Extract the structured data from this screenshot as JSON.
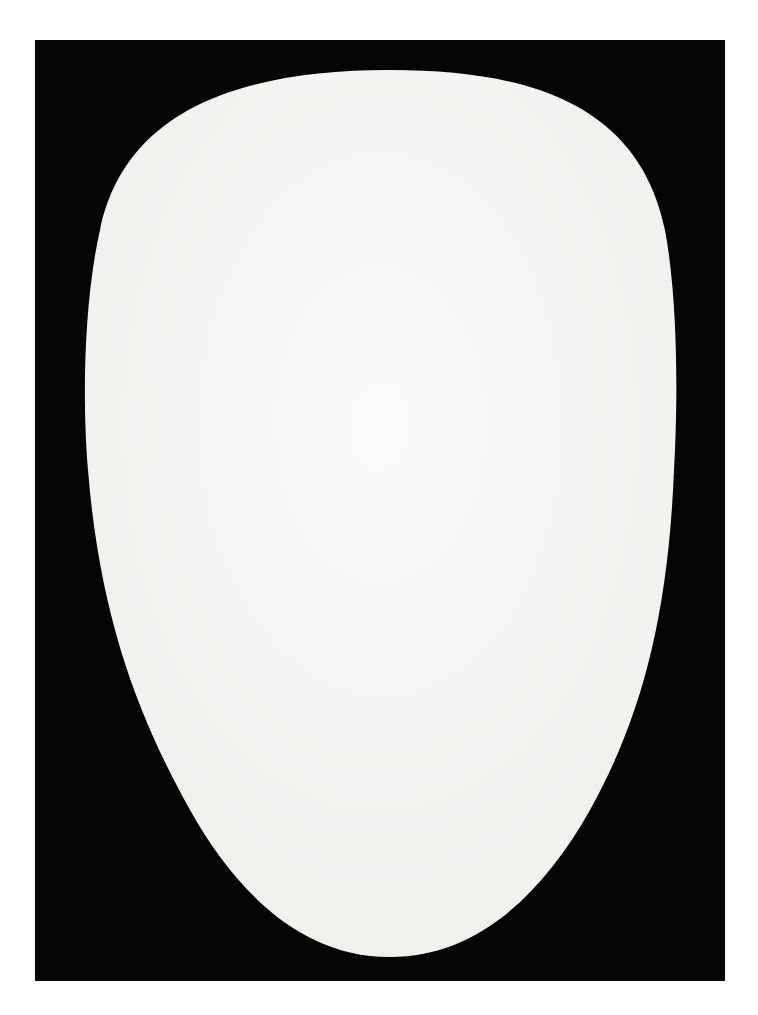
{
  "artwork": {
    "description": "White egg-shaped ovoid form centered on a black rectangular ground",
    "colors": {
      "page_background": "#ffffff",
      "ground": "#050505",
      "form": "#f7f7f5"
    }
  }
}
